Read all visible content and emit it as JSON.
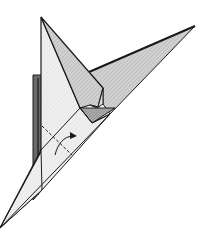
{
  "figure": {
    "type": "origami-diagram",
    "description": "Folded paper model step with a pointed flap at top, a long point to the upper right, and a long point at the bottom left; a dashed valley-fold line and a curved arrow indicate the next fold.",
    "colors": {
      "outline": "#1a1a1a",
      "light_face": "#ececec",
      "mid_face": "#cfcfcf",
      "dark_face": "#9a9a9a",
      "shadow": "#555555",
      "background": "#ffffff"
    },
    "symbols": [
      {
        "name": "valley-fold-line",
        "style": "dashed"
      },
      {
        "name": "fold-arrow",
        "style": "curved-with-head"
      }
    ]
  }
}
